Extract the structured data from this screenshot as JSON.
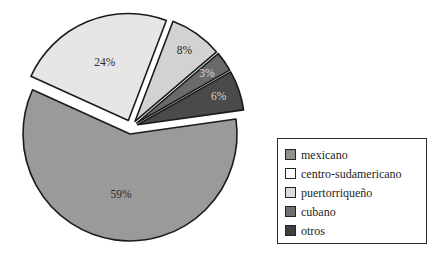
{
  "chart_data": {
    "type": "pie",
    "title": "",
    "subtitle": "",
    "xlabel": "",
    "ylabel": "",
    "legend_position": "right",
    "grid": false,
    "exploded": true,
    "start_angle_deg": -8,
    "categories": [
      "mexicano",
      "centro-sudamericano",
      "puertorriqueño",
      "cubano",
      "otros"
    ],
    "values": [
      59,
      24,
      8,
      3,
      6
    ],
    "value_suffix": "%",
    "data_labels": [
      "59%",
      "24%",
      "8%",
      "3%",
      "6%"
    ],
    "colors": [
      "#9a9a9a",
      "#e6e6e6",
      "#d2d2d2",
      "#6a6a6a",
      "#4a4a4a"
    ],
    "label_text_colors": [
      "#2a2a2a",
      "#2a2a2a",
      "#2a2a2a",
      "#d8d8d8",
      "#d8d8d8"
    ],
    "slices": [
      {
        "label": "mexicano",
        "value": 59,
        "data_label": "59%",
        "color": "#9a9a9a",
        "label_on_dark": false
      },
      {
        "label": "centro-sudamericano",
        "value": 24,
        "data_label": "24%",
        "color": "#e6e6e6",
        "label_on_dark": false
      },
      {
        "label": "puertorriqueño",
        "value": 8,
        "data_label": "8%",
        "color": "#d2d2d2",
        "label_on_dark": false
      },
      {
        "label": "cubano",
        "value": 3,
        "data_label": "3%",
        "color": "#6a6a6a",
        "label_on_dark": true
      },
      {
        "label": "otros",
        "value": 6,
        "data_label": "6%",
        "color": "#4a4a4a",
        "label_on_dark": true
      }
    ]
  },
  "legend": {
    "items": [
      {
        "label": "mexicano",
        "color": "#8f8f8f"
      },
      {
        "label": "centro-sudamericano",
        "color": "#fdfdfd"
      },
      {
        "label": "puertorriqueño",
        "color": "#dcdcdc"
      },
      {
        "label": "cubano",
        "color": "#6f6f6f"
      },
      {
        "label": "otros",
        "color": "#3f3f3f"
      }
    ]
  }
}
